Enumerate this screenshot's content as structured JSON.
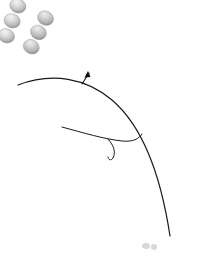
{
  "figure": {
    "title": "Curved array of ellipsoid cells with boundary line",
    "background_color": "#ffffff",
    "width": 217,
    "height": 261
  },
  "style": {
    "cell_fill_light": "#f0f0f0",
    "cell_fill_mid": "#c8c8c8",
    "cell_fill_dark": "#8a8a8a",
    "cell_edge": "#9a9a9a",
    "line_color": "#1a1a1a",
    "arc_color": "#101010",
    "faint_mark_color": "#d8d8d8"
  },
  "geometry": {
    "arc_center_x": -95,
    "arc_center_y": 300,
    "cell_rx": 8.2,
    "cell_ry": 7.0,
    "boundary_radius": 268,
    "row_radii": [
      243,
      258,
      274,
      290
    ],
    "note": "rows are laid out along concentric arcs about the arc center"
  },
  "cell_rows": [
    {
      "id": "row-1",
      "angle": -66.0,
      "count": 3,
      "radii": [
        243,
        259,
        275
      ],
      "arcs": false
    },
    {
      "id": "row-2",
      "angle": -60.0,
      "count": 3,
      "radii": [
        243,
        259,
        275
      ],
      "arcs": false
    },
    {
      "id": "row-3",
      "angle": -54.0,
      "count": 3,
      "radii": [
        243,
        259,
        275
      ],
      "arcs": false
    },
    {
      "id": "row-4",
      "angle": -48.0,
      "count": 3,
      "radii": [
        246,
        262,
        278
      ],
      "arcs": false
    },
    {
      "id": "row-5",
      "angle": -42.0,
      "count": 3,
      "radii": [
        250,
        266,
        282
      ],
      "arcs": true
    },
    {
      "id": "row-6",
      "angle": -36.0,
      "count": 3,
      "radii": [
        252,
        268,
        284
      ],
      "arcs": true
    },
    {
      "id": "row-7",
      "angle": -30.0,
      "count": 3,
      "radii": [
        254,
        270,
        286
      ],
      "arcs": true
    },
    {
      "id": "row-8",
      "angle": -24.0,
      "count": 3,
      "radii": [
        256,
        272,
        288
      ],
      "arcs": true
    },
    {
      "id": "row-9",
      "angle": -18.0,
      "count": 3,
      "radii": [
        258,
        274,
        290
      ],
      "arcs": true
    },
    {
      "id": "row-10",
      "angle": -12.0,
      "count": 3,
      "radii": [
        278,
        294,
        310
      ],
      "arcs": false
    },
    {
      "id": "row-11",
      "angle": -6.5,
      "count": 3,
      "radii": [
        280,
        296,
        312
      ],
      "arcs": false
    },
    {
      "id": "row-12",
      "angle": -1.0,
      "count": 3,
      "radii": [
        281,
        297,
        313
      ],
      "arcs": false
    },
    {
      "id": "row-13",
      "angle": 4.5,
      "count": 3,
      "radii": [
        282,
        298,
        314
      ],
      "arcs": false
    },
    {
      "id": "row-14",
      "angle": 10.0,
      "count": 3,
      "radii": [
        283,
        299,
        315
      ],
      "arcs": false
    },
    {
      "id": "row-15",
      "angle": 15.5,
      "count": 3,
      "radii": [
        283,
        299,
        315
      ],
      "arcs": false
    },
    {
      "id": "row-16",
      "angle": 21.0,
      "count": 3,
      "radii": [
        283,
        299,
        315
      ],
      "arcs": false
    },
    {
      "id": "row-17",
      "angle": 26.5,
      "count": 3,
      "radii": [
        283,
        299,
        315
      ],
      "arcs": false
    }
  ],
  "boundary_line": {
    "id": "boundary-curve",
    "label": "boundary line",
    "path": "M 18 85 C 52 72, 86 78, 112 100 C 140 124, 160 170, 170 236",
    "stroke_width": 1.2
  },
  "leader_line": {
    "id": "leader-line",
    "label": "leader line with hook",
    "path": "M 62 127 C 84 133, 104 139, 122 141 C 133 142, 139 139, 142 134",
    "hook_path": "M 108 139 C 114 146, 116 152, 113 158 C 111 161, 108 160, 108 157",
    "stroke_width": 1.0
  },
  "arrow_annotation": {
    "id": "pointer-arrow",
    "label": "pointer arrow",
    "path": "M 82 84 L 89 73",
    "head": "88,71 84.5,77.5 90.5,77"
  },
  "faint_marks": [
    {
      "id": "faint-mark-1",
      "x": 146,
      "y": 246,
      "w": 4,
      "h": 3
    },
    {
      "id": "faint-mark-2",
      "x": 154,
      "y": 247,
      "w": 3,
      "h": 3
    }
  ]
}
